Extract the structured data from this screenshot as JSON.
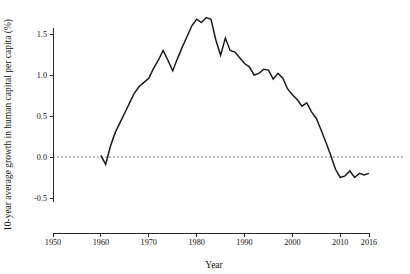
{
  "chart_data": {
    "type": "line",
    "title": "",
    "xlabel": "Year",
    "ylabel": "10-year average growth in human capital per capita (%)",
    "xlim": [
      1950,
      2016
    ],
    "ylim": [
      -0.5,
      1.75
    ],
    "grid": false,
    "legend": null,
    "annotations": [
      {
        "name": "zero-reference-line",
        "y": 0.0,
        "style": "dotted"
      }
    ],
    "xticks": [
      1950,
      1960,
      1970,
      1980,
      1990,
      2000,
      2010,
      2016
    ],
    "xtick_labels": [
      "1950",
      "1960",
      "1970",
      "1980",
      "1990",
      "2000",
      "2010",
      "2016"
    ],
    "yticks": [
      -0.5,
      0.0,
      0.5,
      1.0,
      1.5
    ],
    "ytick_labels": [
      "-0.5",
      "0.0",
      "0.5",
      "1.0",
      "1.5"
    ],
    "series": [
      {
        "name": "10-year average growth in human capital per capita",
        "color": "#1b1b1b",
        "x": [
          1960,
          1961,
          1962,
          1963,
          1964,
          1965,
          1966,
          1967,
          1968,
          1969,
          1970,
          1971,
          1972,
          1973,
          1974,
          1975,
          1976,
          1977,
          1978,
          1979,
          1980,
          1981,
          1982,
          1983,
          1984,
          1985,
          1986,
          1987,
          1988,
          1989,
          1990,
          1991,
          1992,
          1993,
          1994,
          1995,
          1996,
          1997,
          1998,
          1999,
          2000,
          2001,
          2002,
          2003,
          2004,
          2005,
          2006,
          2007,
          2008,
          2009,
          2010,
          2011,
          2012,
          2013,
          2014,
          2015,
          2016
        ],
        "y": [
          0.02,
          -0.09,
          0.13,
          0.3,
          0.42,
          0.54,
          0.66,
          0.78,
          0.86,
          0.91,
          0.96,
          1.08,
          1.18,
          1.3,
          1.18,
          1.05,
          1.2,
          1.34,
          1.47,
          1.6,
          1.68,
          1.64,
          1.7,
          1.68,
          1.43,
          1.24,
          1.45,
          1.3,
          1.28,
          1.21,
          1.14,
          1.1,
          1.0,
          1.02,
          1.07,
          1.06,
          0.95,
          1.02,
          0.96,
          0.83,
          0.76,
          0.7,
          0.62,
          0.66,
          0.55,
          0.47,
          0.33,
          0.18,
          0.02,
          -0.15,
          -0.25,
          -0.23,
          -0.17,
          -0.25,
          -0.2,
          -0.22,
          -0.2
        ]
      }
    ]
  },
  "axis": {
    "x_title": "Year",
    "y_title": "10-year average growth in human capital per capita (%)"
  }
}
